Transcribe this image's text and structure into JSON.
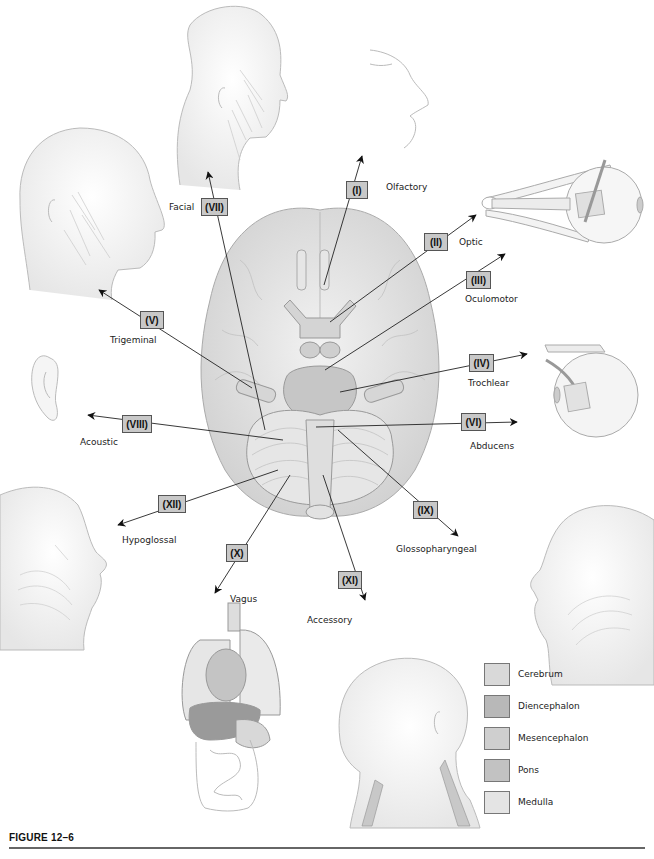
{
  "figure": {
    "caption": "FIGURE 12–6"
  },
  "nerves": [
    {
      "numeral": "(I)",
      "name": "Olfactory"
    },
    {
      "numeral": "(II)",
      "name": "Optic"
    },
    {
      "numeral": "(III)",
      "name": "Oculomotor"
    },
    {
      "numeral": "(IV)",
      "name": "Trochlear"
    },
    {
      "numeral": "(V)",
      "name": "Trigeminal"
    },
    {
      "numeral": "(VI)",
      "name": "Abducens"
    },
    {
      "numeral": "(VII)",
      "name": "Facial"
    },
    {
      "numeral": "(VIII)",
      "name": "Acoustic"
    },
    {
      "numeral": "(IX)",
      "name": "Glossopharyngeal"
    },
    {
      "numeral": "(X)",
      "name": "Vagus"
    },
    {
      "numeral": "(XI)",
      "name": "Accessory"
    },
    {
      "numeral": "(XII)",
      "name": "Hypoglossal"
    }
  ],
  "legend": {
    "items": [
      {
        "label": "Cerebrum",
        "color": "#d9d9d9"
      },
      {
        "label": "Diencephalon",
        "color": "#b8b8b8"
      },
      {
        "label": "Mesencephalon",
        "color": "#cfcfcf"
      },
      {
        "label": "Pons",
        "color": "#c2c2c2"
      },
      {
        "label": "Medulla",
        "color": "#e4e4e4"
      }
    ]
  },
  "illustrations": [
    "facial-head",
    "olfactory-nose",
    "trigeminal-head",
    "optic-eye",
    "acoustic-ear",
    "trochlear-eye",
    "hypoglossal-head",
    "glossopharyngeal-head",
    "vagus-organs",
    "accessory-head-neck",
    "brain-inferior-view"
  ]
}
